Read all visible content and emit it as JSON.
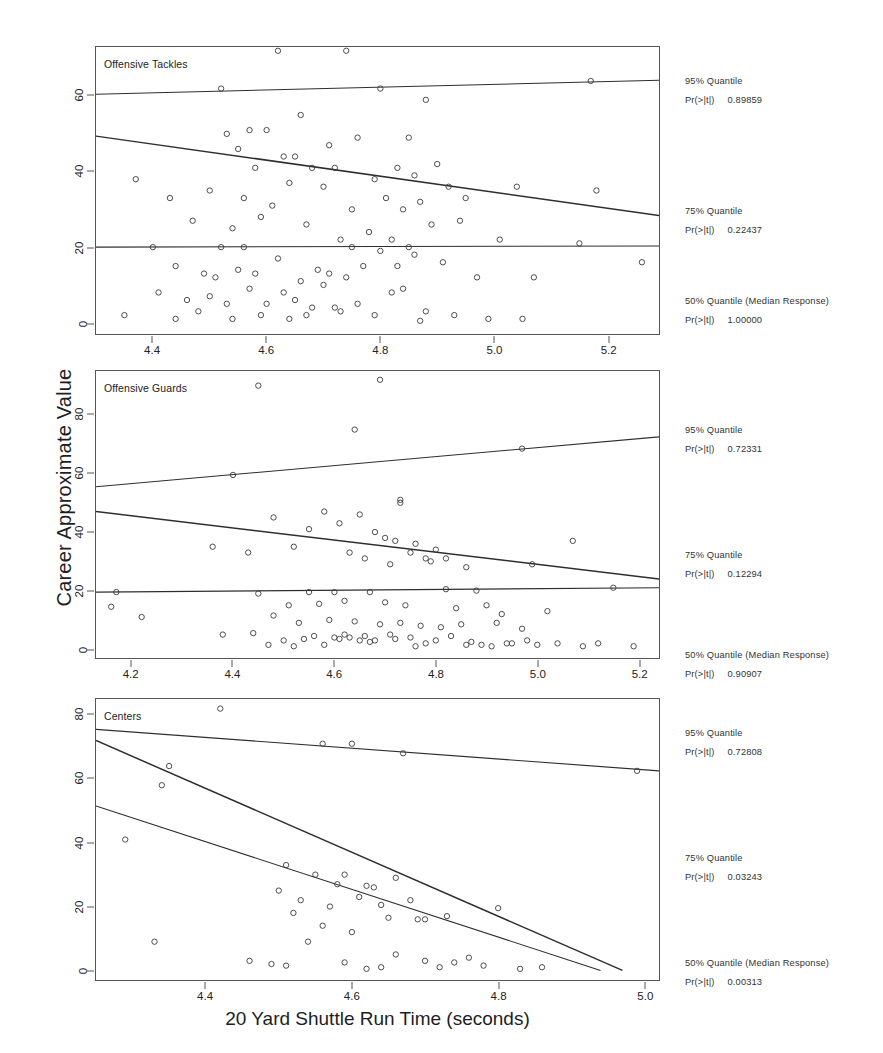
{
  "chart_data": {
    "type": "scatter",
    "title": "",
    "xlabel": "20 Yard Shuttle Run Time (seconds)",
    "ylabel": "Career Approximate Value",
    "grid": false,
    "legend_position": "right",
    "panels": [
      {
        "name": "Offensive Tackles",
        "xlim": [
          4.3,
          5.29
        ],
        "ylim": [
          -3,
          73
        ],
        "xticks": [
          4.4,
          4.6,
          4.8,
          5.0,
          5.2
        ],
        "xticklabels": [
          "4.4",
          "4.6",
          "4.8",
          "5.0",
          "5.2"
        ],
        "yticks": [
          0,
          20,
          40,
          60
        ],
        "yticklabels": [
          "0",
          "20",
          "40",
          "60"
        ],
        "annotations": [
          {
            "quantile_label": "95% Quantile",
            "p_label": "Pr(>|t|)",
            "p_value": "0.89859"
          },
          {
            "quantile_label": "75% Quantile",
            "p_label": "Pr(>|t|)",
            "p_value": "0.22437"
          },
          {
            "quantile_label": "50% Quantile (Median Response)",
            "p_label": "Pr(>|t|)",
            "p_value": "1.00000"
          }
        ],
        "fits": [
          {
            "name": "95% Quantile",
            "x": [
              4.3,
              5.29
            ],
            "y": [
              60.5,
              64.2
            ]
          },
          {
            "name": "75% Quantile",
            "x": [
              4.3,
              5.29
            ],
            "y": [
              49.4,
              28.4
            ]
          },
          {
            "name": "50% Quantile (Median Response)",
            "x": [
              4.3,
              5.29
            ],
            "y": [
              20.0,
              20.3
            ]
          }
        ],
        "points": [
          [
            4.52,
            62.0
          ],
          [
            4.62,
            72.0
          ],
          [
            4.74,
            72.0
          ],
          [
            4.8,
            62.0
          ],
          [
            5.17,
            64.0
          ],
          [
            4.66,
            55.0
          ],
          [
            4.57,
            51.0
          ],
          [
            4.6,
            51.0
          ],
          [
            4.76,
            49.0
          ],
          [
            4.85,
            49.0
          ],
          [
            4.55,
            46.0
          ],
          [
            4.63,
            44.0
          ],
          [
            4.65,
            44.0
          ],
          [
            4.71,
            47.0
          ],
          [
            4.88,
            59.0
          ],
          [
            4.37,
            38.0
          ],
          [
            4.53,
            50.0
          ],
          [
            4.58,
            41.0
          ],
          [
            4.68,
            41.0
          ],
          [
            4.72,
            41.0
          ],
          [
            4.79,
            38.0
          ],
          [
            4.83,
            41.0
          ],
          [
            4.86,
            39.0
          ],
          [
            4.9,
            42.0
          ],
          [
            4.92,
            36.0
          ],
          [
            4.43,
            33.0
          ],
          [
            4.5,
            35.0
          ],
          [
            4.56,
            33.0
          ],
          [
            4.61,
            31.0
          ],
          [
            4.64,
            37.0
          ],
          [
            4.7,
            36.0
          ],
          [
            4.75,
            30.0
          ],
          [
            4.81,
            33.0
          ],
          [
            4.84,
            30.0
          ],
          [
            4.87,
            32.0
          ],
          [
            4.95,
            33.0
          ],
          [
            5.04,
            36.0
          ],
          [
            5.18,
            35.0
          ],
          [
            4.47,
            27.0
          ],
          [
            4.54,
            25.0
          ],
          [
            4.59,
            28.0
          ],
          [
            4.67,
            26.0
          ],
          [
            4.73,
            22.0
          ],
          [
            4.78,
            24.0
          ],
          [
            4.82,
            22.0
          ],
          [
            4.89,
            26.0
          ],
          [
            4.94,
            27.0
          ],
          [
            5.01,
            22.0
          ],
          [
            4.4,
            20.0
          ],
          [
            4.52,
            20.0
          ],
          [
            4.56,
            20.0
          ],
          [
            4.75,
            20.0
          ],
          [
            4.85,
            20.0
          ],
          [
            5.15,
            21.0
          ],
          [
            4.44,
            15.0
          ],
          [
            4.49,
            13.0
          ],
          [
            4.51,
            12.0
          ],
          [
            4.55,
            14.0
          ],
          [
            4.58,
            13.0
          ],
          [
            4.62,
            17.0
          ],
          [
            4.66,
            11.0
          ],
          [
            4.69,
            14.0
          ],
          [
            4.71,
            13.0
          ],
          [
            4.74,
            12.0
          ],
          [
            4.77,
            15.0
          ],
          [
            4.8,
            19.0
          ],
          [
            4.83,
            15.0
          ],
          [
            4.86,
            18.0
          ],
          [
            4.91,
            16.0
          ],
          [
            4.97,
            12.0
          ],
          [
            5.07,
            12.0
          ],
          [
            5.26,
            16.0
          ],
          [
            4.41,
            8.0
          ],
          [
            4.46,
            6.0
          ],
          [
            4.5,
            7.0
          ],
          [
            4.53,
            5.0
          ],
          [
            4.57,
            9.0
          ],
          [
            4.6,
            5.0
          ],
          [
            4.63,
            8.0
          ],
          [
            4.65,
            6.0
          ],
          [
            4.68,
            4.0
          ],
          [
            4.7,
            10.0
          ],
          [
            4.73,
            3.0
          ],
          [
            4.76,
            5.0
          ],
          [
            4.79,
            2.0
          ],
          [
            4.82,
            8.0
          ],
          [
            4.84,
            9.0
          ],
          [
            4.88,
            3.0
          ],
          [
            4.93,
            2.0
          ],
          [
            4.99,
            1.0
          ],
          [
            4.35,
            2.0
          ],
          [
            4.44,
            1.0
          ],
          [
            4.48,
            3.0
          ],
          [
            4.54,
            1.0
          ],
          [
            4.59,
            2.0
          ],
          [
            4.64,
            1.0
          ],
          [
            4.67,
            2.0
          ],
          [
            4.72,
            4.0
          ],
          [
            4.87,
            0.5
          ],
          [
            5.05,
            1.0
          ]
        ]
      },
      {
        "name": "Offensive Guards",
        "xlim": [
          4.13,
          5.24
        ],
        "ylim": [
          -3,
          95
        ],
        "xticks": [
          4.2,
          4.4,
          4.6,
          4.8,
          5.0,
          5.2
        ],
        "xticklabels": [
          "4.2",
          "4.4",
          "4.6",
          "4.8",
          "5.0",
          "5.2"
        ],
        "yticks": [
          0,
          20,
          40,
          60,
          80
        ],
        "yticklabels": [
          "0",
          "20",
          "40",
          "60",
          "80"
        ],
        "annotations": [
          {
            "quantile_label": "95% Quantile",
            "p_label": "Pr(>|t|)",
            "p_value": "0.72331"
          },
          {
            "quantile_label": "75% Quantile",
            "p_label": "Pr(>|t|)",
            "p_value": "0.12294"
          },
          {
            "quantile_label": "50% Quantile (Median Response)",
            "p_label": "Pr(>|t|)",
            "p_value": "0.90907"
          }
        ],
        "fits": [
          {
            "name": "95% Quantile",
            "x": [
              4.13,
              5.24
            ],
            "y": [
              55.5,
              72.5
            ]
          },
          {
            "name": "75% Quantile",
            "x": [
              4.13,
              5.24
            ],
            "y": [
              47.0,
              24.0
            ]
          },
          {
            "name": "50% Quantile (Median Response)",
            "x": [
              4.13,
              5.24
            ],
            "y": [
              19.5,
              21.0
            ]
          }
        ],
        "points": [
          [
            4.45,
            90.0
          ],
          [
            4.69,
            92.0
          ],
          [
            4.64,
            75.0
          ],
          [
            4.4,
            59.5
          ],
          [
            4.97,
            68.5
          ],
          [
            4.73,
            51.0
          ],
          [
            4.73,
            50.0
          ],
          [
            4.48,
            45.0
          ],
          [
            4.58,
            47.0
          ],
          [
            4.65,
            46.0
          ],
          [
            4.55,
            41.0
          ],
          [
            4.61,
            43.0
          ],
          [
            4.68,
            40.0
          ],
          [
            4.7,
            38.0
          ],
          [
            4.72,
            37.0
          ],
          [
            4.76,
            36.0
          ],
          [
            4.8,
            34.0
          ],
          [
            4.36,
            35.0
          ],
          [
            4.43,
            33.0
          ],
          [
            4.52,
            35.0
          ],
          [
            4.63,
            33.0
          ],
          [
            4.66,
            31.0
          ],
          [
            4.71,
            29.0
          ],
          [
            4.75,
            33.0
          ],
          [
            4.78,
            31.0
          ],
          [
            4.79,
            30.0
          ],
          [
            4.82,
            31.0
          ],
          [
            4.86,
            28.0
          ],
          [
            4.99,
            29.0
          ],
          [
            5.07,
            37.0
          ],
          [
            4.17,
            19.5
          ],
          [
            4.45,
            19.0
          ],
          [
            4.55,
            19.5
          ],
          [
            4.6,
            19.5
          ],
          [
            4.67,
            19.5
          ],
          [
            4.82,
            20.5
          ],
          [
            4.88,
            20.0
          ],
          [
            5.15,
            21.0
          ],
          [
            4.16,
            14.5
          ],
          [
            4.51,
            15.0
          ],
          [
            4.57,
            15.5
          ],
          [
            4.62,
            16.5
          ],
          [
            4.7,
            16.0
          ],
          [
            4.74,
            15.0
          ],
          [
            4.84,
            14.0
          ],
          [
            4.9,
            15.0
          ],
          [
            4.93,
            12.0
          ],
          [
            5.02,
            13.0
          ],
          [
            4.22,
            11.0
          ],
          [
            4.48,
            11.5
          ],
          [
            4.53,
            9.0
          ],
          [
            4.59,
            10.0
          ],
          [
            4.64,
            9.5
          ],
          [
            4.69,
            8.5
          ],
          [
            4.73,
            9.0
          ],
          [
            4.77,
            8.0
          ],
          [
            4.81,
            7.5
          ],
          [
            4.85,
            8.5
          ],
          [
            4.92,
            9.0
          ],
          [
            4.97,
            7.0
          ],
          [
            4.38,
            5.0
          ],
          [
            4.44,
            5.5
          ],
          [
            4.5,
            3.0
          ],
          [
            4.54,
            3.5
          ],
          [
            4.56,
            4.5
          ],
          [
            4.6,
            4.0
          ],
          [
            4.61,
            3.5
          ],
          [
            4.62,
            5.0
          ],
          [
            4.63,
            4.0
          ],
          [
            4.65,
            3.0
          ],
          [
            4.66,
            4.5
          ],
          [
            4.68,
            3.0
          ],
          [
            4.71,
            5.0
          ],
          [
            4.72,
            3.5
          ],
          [
            4.75,
            4.0
          ],
          [
            4.78,
            2.0
          ],
          [
            4.8,
            3.0
          ],
          [
            4.83,
            4.5
          ],
          [
            4.87,
            2.5
          ],
          [
            4.89,
            1.5
          ],
          [
            4.94,
            2.0
          ],
          [
            4.98,
            3.0
          ],
          [
            5.0,
            1.5
          ],
          [
            5.04,
            2.0
          ],
          [
            5.09,
            1.0
          ],
          [
            5.12,
            2.0
          ],
          [
            5.19,
            1.0
          ],
          [
            4.47,
            1.5
          ],
          [
            4.52,
            1.0
          ],
          [
            4.58,
            1.5
          ],
          [
            4.67,
            2.5
          ],
          [
            4.76,
            1.0
          ],
          [
            4.86,
            1.5
          ],
          [
            4.91,
            1.0
          ],
          [
            4.95,
            2.0
          ]
        ]
      },
      {
        "name": "Centers",
        "xlim": [
          4.25,
          5.02
        ],
        "ylim": [
          -3,
          85
        ],
        "xticks": [
          4.4,
          4.6,
          4.8,
          5.0
        ],
        "xticklabels": [
          "4.4",
          "4.6",
          "4.8",
          "5.0"
        ],
        "yticks": [
          0,
          20,
          40,
          60,
          80
        ],
        "yticklabels": [
          "0",
          "20",
          "40",
          "60",
          "80"
        ],
        "annotations": [
          {
            "quantile_label": "95% Quantile",
            "p_label": "Pr(>|t|)",
            "p_value": "0.72808"
          },
          {
            "quantile_label": "75% Quantile",
            "p_label": "Pr(>|t|)",
            "p_value": "0.03243"
          },
          {
            "quantile_label": "50% Quantile (Median Response)",
            "p_label": "Pr(>|t|)",
            "p_value": "0.00313"
          }
        ],
        "fits": [
          {
            "name": "95% Quantile",
            "x": [
              4.25,
              5.02
            ],
            "y": [
              75.5,
              62.5
            ]
          },
          {
            "name": "75% Quantile",
            "x": [
              4.25,
              4.97
            ],
            "y": [
              72.0,
              0.0
            ]
          },
          {
            "name": "50% Quantile (Median Response)",
            "x": [
              4.25,
              4.94
            ],
            "y": [
              51.5,
              0.0
            ]
          }
        ],
        "points": [
          [
            4.42,
            82.0
          ],
          [
            4.56,
            71.0
          ],
          [
            4.6,
            71.0
          ],
          [
            4.35,
            64.0
          ],
          [
            4.67,
            68.0
          ],
          [
            4.99,
            62.5
          ],
          [
            4.29,
            41.0
          ],
          [
            4.34,
            58.0
          ],
          [
            4.51,
            33.0
          ],
          [
            4.55,
            30.0
          ],
          [
            4.58,
            27.0
          ],
          [
            4.59,
            30.0
          ],
          [
            4.62,
            26.5
          ],
          [
            4.63,
            26.0
          ],
          [
            4.66,
            29.0
          ],
          [
            4.5,
            25.0
          ],
          [
            4.53,
            22.0
          ],
          [
            4.57,
            20.0
          ],
          [
            4.61,
            23.0
          ],
          [
            4.64,
            20.5
          ],
          [
            4.68,
            22.0
          ],
          [
            4.65,
            16.5
          ],
          [
            4.69,
            16.0
          ],
          [
            4.7,
            16.0
          ],
          [
            4.73,
            17.0
          ],
          [
            4.8,
            19.5
          ],
          [
            4.52,
            18.0
          ],
          [
            4.56,
            14.0
          ],
          [
            4.6,
            12.0
          ],
          [
            4.54,
            9.0
          ],
          [
            4.33,
            9.0
          ],
          [
            4.46,
            3.0
          ],
          [
            4.49,
            2.0
          ],
          [
            4.51,
            1.5
          ],
          [
            4.59,
            2.5
          ],
          [
            4.62,
            0.5
          ],
          [
            4.64,
            1.0
          ],
          [
            4.66,
            5.0
          ],
          [
            4.7,
            3.0
          ],
          [
            4.72,
            1.0
          ],
          [
            4.74,
            2.5
          ],
          [
            4.76,
            4.0
          ],
          [
            4.78,
            1.5
          ],
          [
            4.83,
            0.5
          ],
          [
            4.86,
            1.0
          ]
        ]
      }
    ]
  }
}
